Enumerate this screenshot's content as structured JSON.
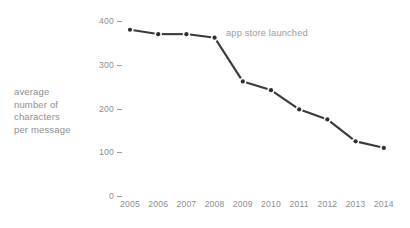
{
  "chart_data": {
    "type": "line",
    "title": "",
    "xlabel": "",
    "ylabel": "average number of characters per message",
    "ylabel_lines": [
      "average",
      "number of",
      "characters",
      "per message"
    ],
    "categories": [
      "2005",
      "2006",
      "2007",
      "2008",
      "2009",
      "2010",
      "2011",
      "2012",
      "2013",
      "2014"
    ],
    "x": [
      2005,
      2006,
      2007,
      2008,
      2009,
      2010,
      2011,
      2012,
      2013,
      2014
    ],
    "values": [
      380,
      370,
      370,
      362,
      262,
      242,
      198,
      175,
      125,
      110
    ],
    "series": [
      {
        "name": "average number of characters per message",
        "values": [
          380,
          370,
          370,
          362,
          262,
          242,
          198,
          175,
          125,
          110
        ]
      }
    ],
    "yticks": [
      0,
      100,
      200,
      300,
      400
    ],
    "ytick_labels": [
      "0",
      "100",
      "200",
      "300",
      "400"
    ],
    "ylim": [
      0,
      420
    ],
    "grid": false,
    "legend": false,
    "marker": "dot",
    "line_color": "#3a3a3a",
    "marker_color": "#2e2e2e",
    "text_color": "#8e8e8e",
    "background_color": "#ffffff",
    "annotations": [
      {
        "text": "app store launched",
        "at_x": 2008,
        "at_y": 362
      }
    ]
  }
}
